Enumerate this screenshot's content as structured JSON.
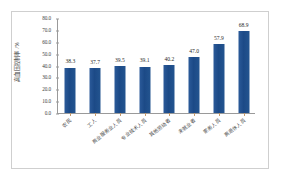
{
  "chart_data": {
    "type": "bar",
    "title": "",
    "subtitle": "",
    "xlabel": "",
    "ylabel": "高血压控制率 /%",
    "ylim": [
      0,
      80
    ],
    "ytick_step": 10,
    "ytick_labels": [
      "80.0",
      "70.0",
      "60.0",
      "50.0",
      "40.0",
      "30.0",
      "20.0",
      "10.0",
      "0.0"
    ],
    "ytick_values": [
      80,
      70,
      60,
      50,
      40,
      30,
      20,
      10,
      0
    ],
    "grid": false,
    "legend": "none",
    "categories": [
      "农民",
      "工人",
      "商业服务业人员",
      "专业技术人员",
      "其他劳动者",
      "未就业者",
      "家务人员",
      "离退休人员"
    ],
    "values": [
      38.3,
      37.7,
      39.5,
      39.1,
      40.2,
      47.0,
      57.9,
      68.9
    ],
    "value_labels": [
      "38.3",
      "37.7",
      "39.5",
      "39.1",
      "40.2",
      "47.0",
      "57.9",
      "68.9"
    ],
    "series": [
      {
        "name": "高血压控制率",
        "values": [
          38.3,
          37.7,
          39.5,
          39.1,
          40.2,
          47.0,
          57.9,
          68.9
        ]
      }
    ],
    "colors": {
      "bar": "#1f4e8c",
      "axis": "#9a9a9a",
      "tick_mark": "#c79a6a",
      "text": "#3a3a3a",
      "frame": "#cfcfcf",
      "background": "#ffffff"
    }
  }
}
